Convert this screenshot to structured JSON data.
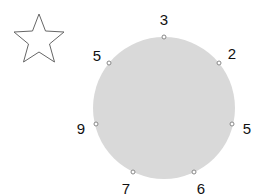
{
  "star": {
    "icon": "star-outline-icon",
    "stroke": "#666666"
  },
  "circle": {
    "cx": 164,
    "cy": 108,
    "r": 71,
    "fill": "#d9d9d9"
  },
  "points": [
    {
      "value": "3",
      "x": 164,
      "y": 37,
      "lx": 164,
      "ly": 19
    },
    {
      "value": "2",
      "x": 219,
      "y": 63,
      "lx": 232,
      "ly": 53
    },
    {
      "value": "5",
      "x": 232,
      "y": 124,
      "lx": 247,
      "ly": 128
    },
    {
      "value": "6",
      "x": 194,
      "y": 172,
      "lx": 201,
      "ly": 188
    },
    {
      "value": "7",
      "x": 133,
      "y": 172,
      "lx": 126,
      "ly": 188
    },
    {
      "value": "9",
      "x": 96,
      "y": 124,
      "lx": 81,
      "ly": 128
    },
    {
      "value": "5",
      "x": 109,
      "y": 63,
      "lx": 97,
      "ly": 55
    }
  ]
}
